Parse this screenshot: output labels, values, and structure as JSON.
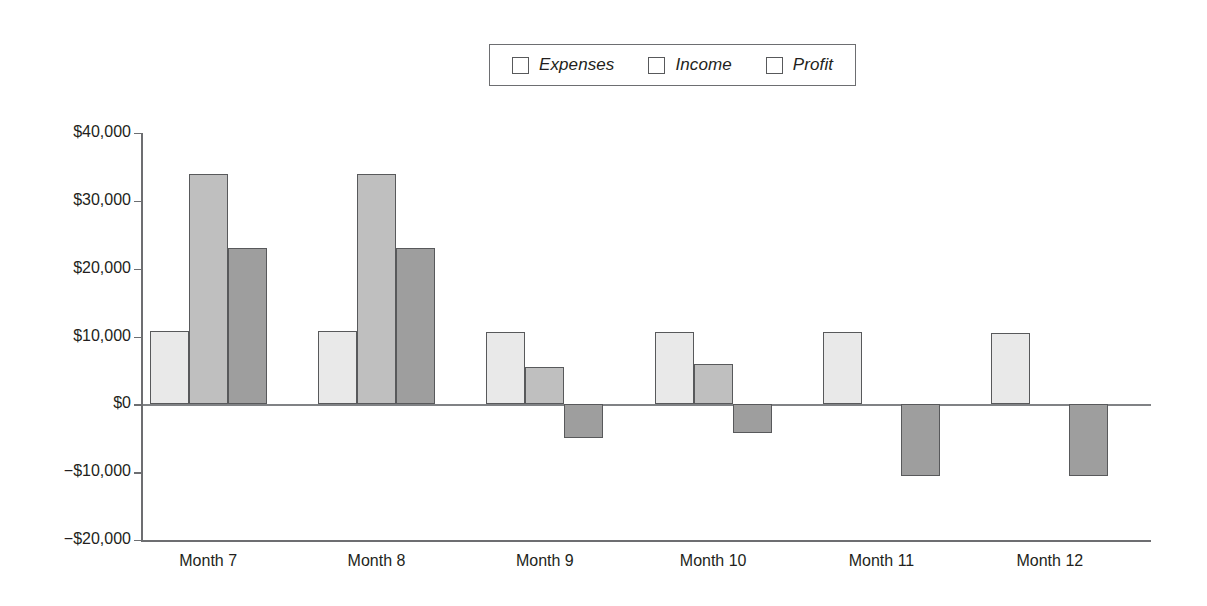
{
  "chart_data": {
    "type": "bar",
    "title": "",
    "xlabel": "",
    "ylabel": "",
    "categories": [
      "Month 7",
      "Month 8",
      "Month 9",
      "Month 10",
      "Month 11",
      "Month 12"
    ],
    "series": [
      {
        "name": "Expenses",
        "color": "#e9e9e9",
        "values": [
          10800,
          10800,
          10700,
          10600,
          10600,
          10500
        ]
      },
      {
        "name": "Income",
        "color": "#bfbfbf",
        "values": [
          33900,
          33900,
          5500,
          6000,
          null,
          null
        ]
      },
      {
        "name": "Profit",
        "color": "#9e9e9e",
        "values": [
          23100,
          23100,
          -4900,
          -4300,
          -10500,
          -10600
        ]
      }
    ],
    "ylim": [
      -20000,
      40000
    ],
    "ytick_values": [
      40000,
      30000,
      20000,
      10000,
      0,
      -10000,
      -20000
    ],
    "ytick_labels": [
      "$40,000",
      "$30,000",
      "$20,000",
      "$10,000",
      "$0",
      "−$10,000",
      "−$20,000"
    ],
    "grid": false,
    "legend_position": "top-center",
    "legend_entries": [
      "Expenses",
      "Income",
      "Profit"
    ],
    "zero_line": true
  }
}
